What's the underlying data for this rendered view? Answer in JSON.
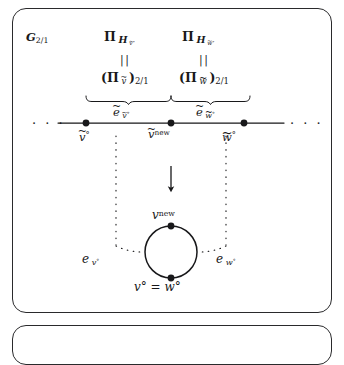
{
  "figure": {
    "type": "mathematical-diagram",
    "frame_label": {
      "base": "G",
      "subscript": "2/1",
      "full": "G_{2/1}"
    },
    "top_row": {
      "left": {
        "pi_symbol": "Π",
        "subscript": "H",
        "subscript_arg": "v",
        "subscript_arg_accent": "tilde",
        "subscript_arg_degree": "°",
        "full": "Π_{ℋ_{ẽ°}}"
      },
      "right": {
        "pi_symbol": "Π",
        "subscript": "H",
        "subscript_arg": "w",
        "subscript_arg_accent": "tilde",
        "subscript_arg_degree": "°",
        "full": "Π_{ℋ_{w̃°}}"
      }
    },
    "equals_bars": {
      "glyph": "||",
      "left_label": "parallel-equals-left",
      "right_label": "parallel-equals-right"
    },
    "second_row": {
      "left": {
        "open": "(",
        "pi_symbol": "Π",
        "subscript_arg": "v",
        "close": ")",
        "outer_subscript": "2/1",
        "full": "(Π_{ẽ})_{2/1}"
      },
      "right": {
        "open": "(",
        "pi_symbol": "Π",
        "subscript_arg": "w",
        "close": ")",
        "outer_subscript": "2/1",
        "full": "(Π_{w̃})_{2/1}"
      }
    },
    "brace_labels": {
      "left": {
        "base": "e",
        "accent": "tilde",
        "subscript": "v",
        "subscript_degree": "°",
        "full": "ẽ_{ẽ°}"
      },
      "right": {
        "base": "e",
        "accent": "tilde",
        "subscript": "w",
        "subscript_degree": "°",
        "full": "ẽ_{w̃°}"
      }
    },
    "upper_graph": {
      "ellipsis_left": "· · ·",
      "ellipsis_right": "· · ·",
      "vertices": [
        {
          "id": "v-tilde-circ",
          "label_base": "v",
          "accent": "tilde",
          "superscript": "°",
          "full": "ẽ°"
        },
        {
          "id": "v-tilde-new",
          "label_base": "v",
          "accent": "tilde",
          "superscript": "new",
          "full": "ẽ^{new}"
        },
        {
          "id": "w-tilde-circ",
          "label_base": "w",
          "accent": "tilde",
          "superscript": "°",
          "full": "w̃°"
        }
      ],
      "edges": [
        {
          "id": "edge-left",
          "from": "v-tilde-circ",
          "to": "v-tilde-new"
        },
        {
          "id": "edge-right",
          "from": "v-tilde-new",
          "to": "w-tilde-circ"
        }
      ]
    },
    "transform_arrow": {
      "glyph": "↓",
      "direction": "down",
      "name": "contraction-arrow"
    },
    "lower_graph": {
      "shape": "loop",
      "vertices": [
        {
          "id": "v-new-loop",
          "label_base": "v",
          "superscript": "new",
          "full": "v^{new}"
        },
        {
          "id": "v-circ-eq-w-circ",
          "full": "v° = w°"
        }
      ],
      "edge_labels": {
        "left": {
          "base": "e",
          "subscript": "v",
          "subscript_degree": "°",
          "full": "e_{v°}"
        },
        "right": {
          "base": "e",
          "subscript": "w",
          "subscript_degree": "°",
          "full": "e_{w°}"
        }
      }
    },
    "colors": {
      "ink": "#18181a",
      "rule": "#2a2a2c",
      "background": "#ffffff"
    }
  }
}
